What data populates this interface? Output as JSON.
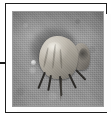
{
  "figure": {
    "kind": "framed-photograph-panel",
    "caption": "",
    "label": "",
    "frame": {
      "style": "thin black rectangular rule",
      "border_color": "#1e1e1e",
      "mat_color": "#fdfdfd",
      "page_background": "#ffffff"
    },
    "leader_line": {
      "name": "leader-line",
      "description": "short horizontal black rule entering the frame from the left page margin",
      "color": "#1c1c1c",
      "orientation": "horizontal"
    },
    "photo": {
      "name": "specimen-photograph",
      "color_mode": "grayscale",
      "subject": "insect specimen resting on a textured gray substrate",
      "background_description": "mottled, grainy mid-gray surface with a darker band across the top",
      "background_color": "#9b9b9b",
      "shadow_color": "#3a3a3a",
      "subject_highlight_color": "#dcd8cf",
      "subject_shadow_color": "#6b6761",
      "leg_color": "#2b2926",
      "elements": [
        {
          "name": "specimen-shadow",
          "label": "cast shadow behind specimen"
        },
        {
          "name": "specimen-body",
          "label": "pale ridged body of the insect"
        },
        {
          "name": "specimen-tail",
          "label": "darker rear tuft of the insect"
        },
        {
          "name": "specimen-legs",
          "label": "dark slender legs"
        },
        {
          "name": "specimen-probe",
          "label": "long thin appendage reaching the substrate"
        },
        {
          "name": "substrate-speck",
          "label": "small bright speck on the substrate"
        }
      ]
    }
  }
}
